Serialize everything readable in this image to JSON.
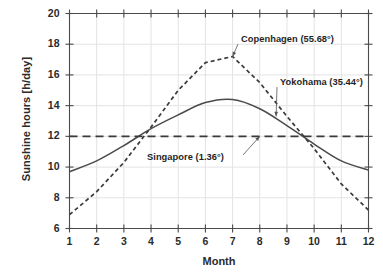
{
  "chart_data": {
    "type": "line",
    "title": "",
    "xlabel": "Month",
    "ylabel": "Sunshine hours  [h/day]",
    "x": [
      1,
      2,
      3,
      4,
      5,
      6,
      7,
      8,
      9,
      10,
      11,
      12
    ],
    "xtick_labels": [
      "1",
      "2",
      "3",
      "4",
      "5",
      "6",
      "7",
      "8",
      "9",
      "10",
      "11",
      "12"
    ],
    "ytick_labels": [
      "6",
      "8",
      "10",
      "12",
      "14",
      "16",
      "18",
      "20"
    ],
    "yticks": [
      6,
      8,
      10,
      12,
      14,
      16,
      18,
      20
    ],
    "xlim": [
      1,
      12
    ],
    "ylim": [
      6,
      20
    ],
    "grid": true,
    "legend_position": "inline-annotations",
    "series": [
      {
        "name": "Copenhagen (55.68°)",
        "style": "dashed-short",
        "color": "#3a3a3a",
        "values": [
          6.9,
          8.4,
          10.3,
          12.6,
          15.0,
          16.8,
          17.2,
          15.5,
          13.3,
          11.2,
          8.9,
          7.2
        ]
      },
      {
        "name": "Yokohama (35.44°)",
        "style": "solid",
        "color": "#4a4a4a",
        "values": [
          9.7,
          10.4,
          11.4,
          12.5,
          13.4,
          14.2,
          14.4,
          13.8,
          12.7,
          11.5,
          10.4,
          9.8
        ]
      },
      {
        "name": "Singapore (1.36°)",
        "style": "dashed-long",
        "color": "#3a3a3a",
        "values": [
          12.0,
          12.0,
          12.0,
          12.0,
          12.0,
          12.0,
          12.0,
          12.0,
          12.0,
          12.0,
          12.0,
          12.0
        ]
      }
    ],
    "annotations": [
      {
        "text": "Copenhagen (55.68°)",
        "target_x": 7.0,
        "target_y": 17.2
      },
      {
        "text": "Yokohama (35.44°)",
        "target_x": 8.6,
        "target_y": 13.3
      },
      {
        "text": "Singapore (1.36°)",
        "target_x": 8.0,
        "target_y": 12.0
      }
    ],
    "colors": {
      "axis": "#4a4a4a",
      "grid": "#e3e3e3",
      "text": "#2b2b2b"
    }
  }
}
